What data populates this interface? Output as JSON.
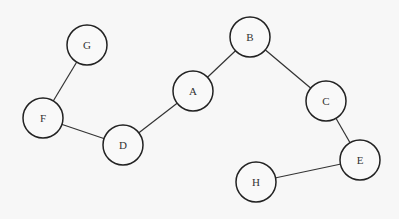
{
  "diagram": {
    "type": "undirected-graph",
    "nodes": [
      {
        "id": "G",
        "label": "G",
        "x": 87,
        "y": 45
      },
      {
        "id": "F",
        "label": "F",
        "x": 43,
        "y": 118
      },
      {
        "id": "D",
        "label": "D",
        "x": 123,
        "y": 145
      },
      {
        "id": "A",
        "label": "A",
        "x": 193,
        "y": 91
      },
      {
        "id": "B",
        "label": "B",
        "x": 250,
        "y": 37
      },
      {
        "id": "C",
        "label": "C",
        "x": 326,
        "y": 101
      },
      {
        "id": "E",
        "label": "E",
        "x": 360,
        "y": 160
      },
      {
        "id": "H",
        "label": "H",
        "x": 256,
        "y": 182
      }
    ],
    "edges": [
      {
        "from": "G",
        "to": "F"
      },
      {
        "from": "F",
        "to": "D"
      },
      {
        "from": "D",
        "to": "A"
      },
      {
        "from": "A",
        "to": "B"
      },
      {
        "from": "B",
        "to": "C"
      },
      {
        "from": "C",
        "to": "E"
      },
      {
        "from": "E",
        "to": "H"
      }
    ],
    "node_radius": 20
  }
}
